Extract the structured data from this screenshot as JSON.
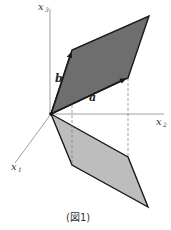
{
  "figure": {
    "caption": "(図1)",
    "axes": {
      "x1": {
        "label": "x",
        "sub": "1"
      },
      "x2": {
        "label": "x",
        "sub": "2"
      },
      "x3": {
        "label": "x",
        "sub": "3"
      }
    },
    "vectors": {
      "a": {
        "label": "a"
      },
      "b": {
        "label": "b"
      }
    },
    "colors": {
      "upper_fill": "#6e6e6e",
      "lower_fill": "#bdbdbd",
      "edge": "#1a1a1a",
      "axis": "#888888",
      "dashed": "#777777"
    }
  }
}
